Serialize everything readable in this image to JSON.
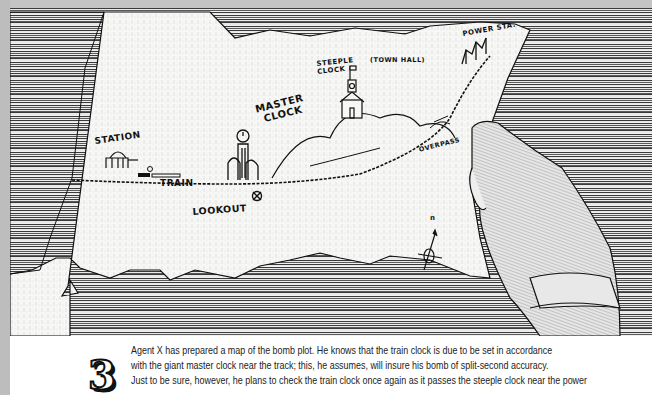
{
  "illustration": {
    "description": "Hand-drawn map held by a hand on a wooden table",
    "map_labels": {
      "station": "STATION",
      "train": "TRAIN",
      "master_clock": [
        "MASTER",
        "CLOCK"
      ],
      "steeple_clock": [
        "STEEPLE",
        "CLOCK"
      ],
      "town_hall": "(TOWN HALL)",
      "power_station": "POWER STA.",
      "overpass": "OVERPASS",
      "lookout": "LOOKOUT",
      "compass_north": "n"
    },
    "colors": {
      "ink": "#111111",
      "paper": "#f7f7f5",
      "frame": "#bdbdbd"
    }
  },
  "caption": {
    "step_number": "3",
    "lines": [
      "Agent X has prepared a map of the bomb plot. He knows that the train clock is due to be set in accordance",
      "with the giant master clock near the track; this, he assumes, will insure his bomb of split-second accuracy.",
      "Just to be sure, however, he plans to check the train clock once again as it passes the steeple clock near the power"
    ]
  }
}
